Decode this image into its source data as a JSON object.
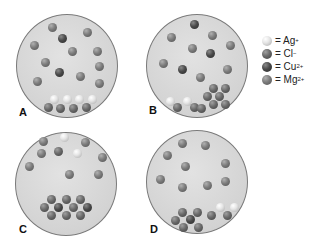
{
  "panels": [
    {
      "id": "A",
      "label": "A"
    },
    {
      "id": "B",
      "label": "B"
    },
    {
      "id": "C",
      "label": "C"
    },
    {
      "id": "D",
      "label": "D"
    }
  ],
  "legend": {
    "items": [
      {
        "ion": "ag",
        "prefix": "= Ag",
        "charge": "+"
      },
      {
        "ion": "cl",
        "prefix": "= Cl",
        "charge": "−"
      },
      {
        "ion": "cu",
        "prefix": "= Cu",
        "charge": "2+"
      },
      {
        "ion": "mg",
        "prefix": "= Mg",
        "charge": "2+"
      }
    ]
  },
  "colors": {
    "beaker_fill": "#d6d6d6",
    "beaker_border": "#7a7a7a",
    "ag": "#e6e6e6",
    "cl": "#6a6a6a",
    "cu": "#4a4a4a",
    "mg": "#7c7c7c"
  }
}
